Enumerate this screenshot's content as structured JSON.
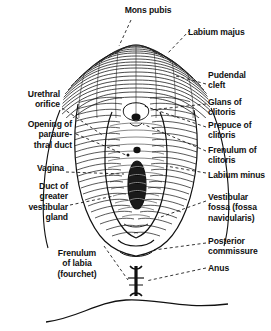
{
  "figure": {
    "ink_color": "#111111",
    "background_color": "#ffffff"
  },
  "labels": {
    "mons_pubis": "Mons pubis",
    "labium_majus": "Labium majus",
    "pudendal_cleft": "Pudendal\ncleft",
    "glans_of_clitoris": "Glans of\nclitoris",
    "prepuce_of_clitoris": "Prepuce of\nclitoris",
    "frenulum_of_clitoris": "Frenulum of\nclitoris",
    "labium_minus": "Labium minus",
    "vestibular_fossa": "Vestibular\nfossa (fossa\nnavicularis)",
    "posterior_commissure": "Posterior\ncommissure",
    "anus": "Anus",
    "urethral_orifice": "Urethral\norifice",
    "opening_of_paraurethral_duct": "Opening of\nparaure-\nthral duct",
    "vagina": "Vagina",
    "duct_of_greater_vestibular_gland": "Duct of\ngreater\nvestibular\ngland",
    "frenulum_of_labia": "Frenulum\nof labia\n(fourchet)"
  }
}
